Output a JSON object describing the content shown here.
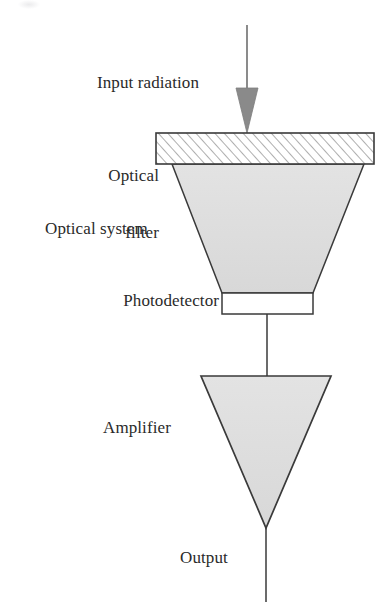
{
  "figure": {
    "type": "block-diagram",
    "orientation": "vertical top-to-bottom"
  },
  "labels": {
    "input_radiation": "Input radiation",
    "optical_filter_line1": "Optical",
    "optical_filter_line2": "filter",
    "optical_system": "Optical system",
    "photodetector": "Photodetector",
    "amplifier": "Amplifier",
    "output": "Output"
  },
  "colors": {
    "stroke": "#3a3a3a",
    "fill_gray": "#dedede",
    "arrow_head": "#8a8a8a",
    "arrow_shaft": "#6f6f6f",
    "filter_fill": "#ffffff",
    "hatch": "#6d6d6d",
    "text": "#2a2a2a",
    "background": "#ffffff"
  },
  "blocks": [
    {
      "name": "input-radiation-arrow",
      "shape": "down-arrow",
      "label": "Input radiation",
      "fill": "#8a8a8a"
    },
    {
      "name": "optical-filter",
      "shape": "hatched-rectangle",
      "label": "Optical filter",
      "fill": "#ffffff",
      "hatch": "diagonal"
    },
    {
      "name": "optical-system",
      "shape": "inverted-trapezoid",
      "label": "Optical system",
      "fill": "#dedede"
    },
    {
      "name": "photodetector",
      "shape": "rectangle",
      "label": "Photodetector",
      "fill": "#ffffff"
    },
    {
      "name": "amplifier",
      "shape": "inverted-triangle",
      "label": "Amplifier",
      "fill": "#dedede"
    },
    {
      "name": "output-line",
      "shape": "line",
      "label": "Output",
      "fill": "none"
    }
  ],
  "geometry": {
    "arrow_shaft_x": 247,
    "arrow_top_y": 25,
    "arrow_head_top_y": 88,
    "arrow_tip_y": 132,
    "filter_left": 156,
    "filter_right": 374,
    "filter_top": 133,
    "filter_bottom": 164,
    "trapezoid_top_left": 172,
    "trapezoid_top_right": 364,
    "trapezoid_bottom_left": 222,
    "trapezoid_bottom_right": 313,
    "trapezoid_top_y": 164,
    "trapezoid_bottom_y": 293,
    "detector_left": 222,
    "detector_right": 313,
    "detector_top": 293,
    "detector_bottom": 314,
    "connector_x": 267,
    "connector_top_y": 314,
    "connector_bottom_y": 376,
    "triangle_left": 201,
    "triangle_right": 331,
    "triangle_top_y": 376,
    "triangle_apex_x": 266,
    "triangle_apex_y": 528,
    "output_line_top_y": 528,
    "output_line_bottom_y": 602
  }
}
